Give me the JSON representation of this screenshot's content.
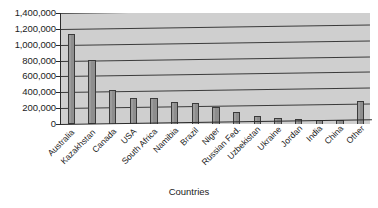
{
  "chart_data": {
    "type": "bar",
    "title": "",
    "xlabel": "Countries",
    "ylabel": "",
    "categories": [
      "Australia",
      "Kazakhstan",
      "Canada",
      "USA",
      "South Africa",
      "Namibia",
      "Brazil",
      "Niger",
      "Russian Fed.",
      "Uzbekistan",
      "Ukraine",
      "Jordan",
      "India",
      "China",
      "Other"
    ],
    "values": [
      1140000,
      815000,
      440000,
      345000,
      350000,
      295000,
      290000,
      245000,
      190000,
      135000,
      112000,
      110000,
      105000,
      100000,
      340000
    ],
    "ylim": [
      0,
      1400000
    ],
    "ytick_values": [
      0,
      200000,
      400000,
      600000,
      800000,
      1000000,
      1200000,
      1400000
    ],
    "ytick_labels": [
      "0",
      "200,000",
      "400,000",
      "600,000",
      "800,000",
      "1,000,000",
      "1,200,000",
      "1,400,000"
    ],
    "grid": true,
    "legend": false,
    "legend_position": "none",
    "colors": {
      "bar_fill": "#8e8e8e",
      "bar_border": "#3a3a3a",
      "plot_background": "#cfcfcf",
      "gridline": "#3b3b3b",
      "axis": "#2b2b2b",
      "text": "#1c1c1c",
      "page_background": "#ffffff"
    }
  }
}
